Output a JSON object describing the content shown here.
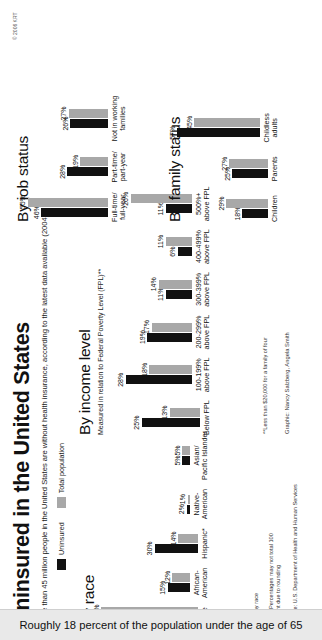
{
  "header": {
    "title": "Uninsured in the United States",
    "subtitle": "More than 45 million people in the United States are without health insurance, according to the latest data available (2004)."
  },
  "legend": {
    "uninsured_label": "Uninsured",
    "total_label": "Total population",
    "uninsured_color": "#111111",
    "total_color": "#a8a8a8"
  },
  "footer": {
    "caption": "Roughly 18 percent of the population under the age of 65",
    "copyright": "© 2006 KRT",
    "credit": "Graphic: Nancy Salzberg, Angela Smith",
    "race_footnote": "*Of any race",
    "race_note": "Note: Percentages may not total 100\npercent due to rounding",
    "race_source": "Source: U.S. Department of Health and Human Services",
    "income_footnote": "**Less than $20,000 for a family of four"
  },
  "chart_data": [
    {
      "type": "bar",
      "title": "By race",
      "subtitle": "",
      "series": [
        {
          "name": "Uninsured",
          "values": [
            48,
            15,
            30,
            2,
            5
          ]
        },
        {
          "name": "Total population",
          "values": [
            67,
            12,
            14,
            1,
            5
          ]
        }
      ],
      "categories": [
        "White",
        "African-\nAmerican",
        "Hispanic*",
        "Native-\nAmerican",
        "Asian/\nPacific Islander"
      ],
      "value_labels": [
        [
          "48%",
          "15%",
          "30%",
          "2%",
          "5%"
        ],
        [
          "67%",
          "12%",
          "14%",
          "1%",
          "5%"
        ]
      ],
      "xlabel": "",
      "ylabel": "",
      "ylim": [
        0,
        70
      ],
      "grid": false,
      "legend_position": "top"
    },
    {
      "type": "bar",
      "title": "By income level",
      "subtitle": "Measured in relation\nto Federal Poverty Level (FPL)**",
      "series": [
        {
          "name": "Uninsured",
          "values": [
            25,
            28,
            19,
            11,
            6,
            11
          ]
        },
        {
          "name": "Total population",
          "values": [
            13,
            18,
            17,
            14,
            11,
            26
          ]
        }
      ],
      "categories": [
        "Below FPL",
        "100-199%\nabove FPL",
        "200-299%\nabove FPL",
        "300-399%\nabove FPL",
        "400-499%\nabove FPL",
        "500%+\nabove FPL"
      ],
      "value_labels": [
        [
          "25%",
          "28%",
          "19%",
          "11%",
          "6%",
          "11%"
        ],
        [
          "13%",
          "18%",
          "17%",
          "14%",
          "11%",
          "26%"
        ]
      ],
      "xlabel": "",
      "ylabel": "",
      "ylim": [
        0,
        30
      ],
      "grid": false,
      "legend_position": "top"
    },
    {
      "type": "bar",
      "title": "By job status",
      "subtitle": "",
      "series": [
        {
          "name": "Uninsured",
          "values": [
            46,
            28,
            26
          ]
        },
        {
          "name": "Total population",
          "values": [
            55,
            19,
            27
          ]
        }
      ],
      "categories": [
        "Full-time/\nfull-year",
        "Part-time/\npart-year",
        "Not in working\nfamilies"
      ],
      "value_labels": [
        [
          "46%",
          "28%",
          "26%"
        ],
        [
          "55%",
          "19%",
          "27%"
        ]
      ],
      "xlabel": "",
      "ylabel": "",
      "ylim": [
        0,
        60
      ],
      "grid": false,
      "legend_position": "top"
    },
    {
      "type": "bar",
      "title": "By family status",
      "subtitle": "",
      "series": [
        {
          "name": "Uninsured",
          "values": [
            18,
            25,
            57
          ]
        },
        {
          "name": "Total population",
          "values": [
            29,
            27,
            45
          ]
        }
      ],
      "categories": [
        "Children",
        "Parents",
        "Childless\nadults"
      ],
      "value_labels": [
        [
          "18%",
          "25%",
          "57%"
        ],
        [
          "29%",
          "27%",
          "45%"
        ]
      ],
      "xlabel": "",
      "ylabel": "",
      "ylim": [
        0,
        60
      ],
      "grid": false,
      "legend_position": "top"
    }
  ]
}
